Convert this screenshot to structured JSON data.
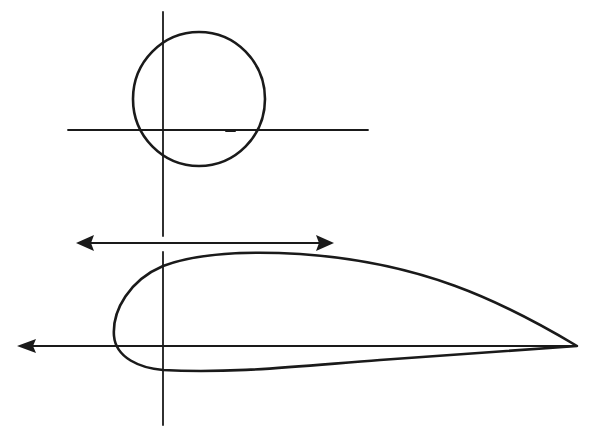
{
  "diagram": {
    "colors": {
      "ink": "#1a1a1a",
      "background": "#ffffff"
    },
    "circle": {
      "cx": 199,
      "cy": 99,
      "r": 66
    },
    "circle_axes": {
      "horizontal": {
        "x1": 68,
        "x2": 368,
        "y": 130
      },
      "vertical": {
        "x": 163,
        "y1": 12,
        "y2": 236
      }
    },
    "double_arrow": {
      "x1": 76,
      "x2": 333,
      "y": 243
    },
    "airfoil_axes": {
      "horizontal_arrow": {
        "x_tip": 17,
        "x_end": 577,
        "y": 346
      },
      "vertical": {
        "x": 163,
        "y1": 252,
        "y2": 425
      }
    },
    "airfoil": {
      "leading_edge": {
        "x": 114,
        "y": 340
      },
      "trailing_edge": {
        "x": 577,
        "y": 346
      },
      "upper_peak": {
        "x": 240,
        "y": 253
      },
      "lower_trough": {
        "x": 220,
        "y": 371
      }
    }
  }
}
